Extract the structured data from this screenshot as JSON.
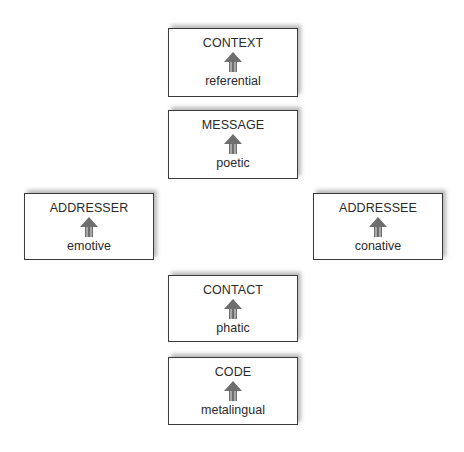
{
  "diagram": {
    "type": "communication-functions-model",
    "arrow_color": "#6e6e6e",
    "border_color": "#3a3a3a",
    "boxes": [
      {
        "id": "context",
        "factor": "CONTEXT",
        "function": "referential",
        "x": 168,
        "y": 28
      },
      {
        "id": "message",
        "factor": "MESSAGE",
        "function": "poetic",
        "x": 168,
        "y": 110
      },
      {
        "id": "addresser",
        "factor": "ADDRESSER",
        "function": "emotive",
        "x": 24,
        "y": 193
      },
      {
        "id": "addressee",
        "factor": "ADDRESSEE",
        "function": "conative",
        "x": 313,
        "y": 193
      },
      {
        "id": "contact",
        "factor": "CONTACT",
        "function": "phatic",
        "x": 168,
        "y": 275
      },
      {
        "id": "code",
        "factor": "CODE",
        "function": "metalingual",
        "x": 168,
        "y": 357
      }
    ]
  }
}
